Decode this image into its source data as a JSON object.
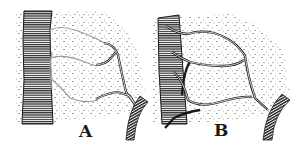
{
  "figure": {
    "panels": [
      {
        "id": "A",
        "label": "A"
      },
      {
        "id": "B",
        "label": "B"
      }
    ],
    "colors": {
      "ink": "#1a1a1a",
      "faint_vessel": "#9a9a9a",
      "background": "#ffffff"
    }
  }
}
